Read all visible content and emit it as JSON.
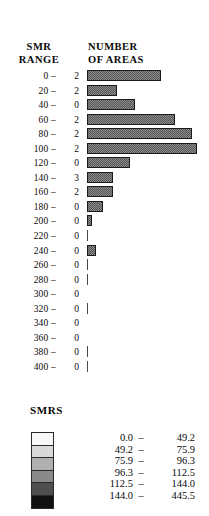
{
  "header": {
    "col1_line1": "SMR",
    "col1_line2": "RANGE",
    "col2_line1": "NUMBER",
    "col2_line2": "OF AREAS"
  },
  "legend": {
    "title": "SMRS",
    "swatch_colors": [
      "#f7f7f7",
      "#d9d9d9",
      "#b0b0b0",
      "#8a8a8a",
      "#4f4f4f",
      "#111111"
    ],
    "rows": [
      {
        "low": "0.0",
        "dash": "–",
        "high": "49.2"
      },
      {
        "low": "49.2",
        "dash": "–",
        "high": "75.9"
      },
      {
        "low": "75.9",
        "dash": "–",
        "high": "96.3"
      },
      {
        "low": "96.3",
        "dash": "–",
        "high": "112.5"
      },
      {
        "low": "112.5",
        "dash": "–",
        "high": "144.0"
      },
      {
        "low": "144.0",
        "dash": "–",
        "high": "445.5"
      }
    ]
  },
  "chart_data": {
    "type": "bar",
    "orientation": "horizontal",
    "title": "",
    "xlabel": "NUMBER OF AREAS",
    "ylabel": "SMR RANGE",
    "grid": false,
    "categories": [
      "0 –",
      "20 –",
      "40 –",
      "60 –",
      "80 –",
      "100 –",
      "120 –",
      "140 –",
      "160 –",
      "180 –",
      "200 –",
      "220 –",
      "240 –",
      "260 –",
      "280 –",
      "300 –",
      "320 –",
      "340 –",
      "360 –",
      "380 –",
      "400 –"
    ],
    "count_labels": [
      "2",
      "2",
      "0",
      "2",
      "2",
      "2",
      "0",
      "3",
      "2",
      "0",
      "0",
      "0",
      "0",
      "0",
      "0",
      "0",
      "0",
      "0",
      "0",
      "0",
      "0"
    ],
    "values": [
      74,
      30,
      48,
      88,
      105,
      110,
      43,
      26,
      26,
      16,
      5,
      1,
      9,
      1,
      2,
      0,
      1,
      0,
      0,
      1,
      1
    ],
    "bar_max": 110,
    "bar_px_max": 110
  },
  "rows": [
    {
      "range": "0 –",
      "count": "2",
      "width": 74
    },
    {
      "range": "20 –",
      "count": "2",
      "width": 30
    },
    {
      "range": "40 –",
      "count": "0",
      "width": 48
    },
    {
      "range": "60 –",
      "count": "2",
      "width": 88
    },
    {
      "range": "80 –",
      "count": "2",
      "width": 105
    },
    {
      "range": "100 –",
      "count": "2",
      "width": 110
    },
    {
      "range": "120 –",
      "count": "0",
      "width": 43
    },
    {
      "range": "140 –",
      "count": "3",
      "width": 26
    },
    {
      "range": "160 –",
      "count": "2",
      "width": 26
    },
    {
      "range": "180 –",
      "count": "0",
      "width": 16
    },
    {
      "range": "200 –",
      "count": "0",
      "width": 5
    },
    {
      "range": "220 –",
      "count": "0",
      "width": 1
    },
    {
      "range": "240 –",
      "count": "0",
      "width": 9
    },
    {
      "range": "260 –",
      "count": "0",
      "width": 1
    },
    {
      "range": "280 –",
      "count": "0",
      "width": 2
    },
    {
      "range": "300 –",
      "count": "0",
      "width": 0
    },
    {
      "range": "320 –",
      "count": "0",
      "width": 1
    },
    {
      "range": "340 –",
      "count": "0",
      "width": 0
    },
    {
      "range": "360 –",
      "count": "0",
      "width": 0
    },
    {
      "range": "380 –",
      "count": "0",
      "width": 1
    },
    {
      "range": "400 –",
      "count": "0",
      "width": 1
    }
  ]
}
